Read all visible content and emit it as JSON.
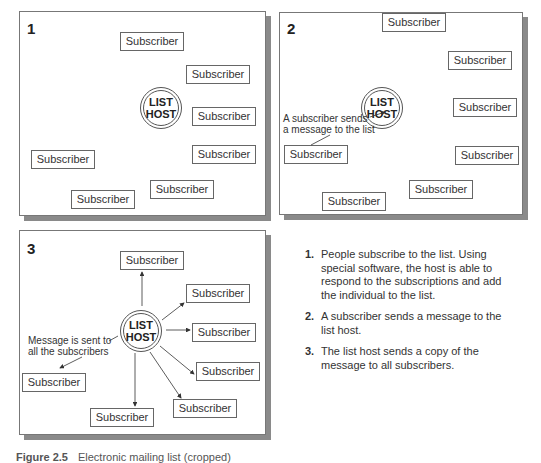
{
  "panels": [
    {
      "number": "1",
      "host_label": [
        "LIST",
        "HOST"
      ],
      "subscribers": [
        "Subscriber",
        "Subscriber",
        "Subscriber",
        "Subscriber",
        "Subscriber",
        "Subscriber",
        "Subscriber"
      ]
    },
    {
      "number": "2",
      "host_label": [
        "LIST",
        "HOST"
      ],
      "annotation": [
        "A subscriber sends",
        "a message to the list"
      ],
      "subscribers": [
        "Subscriber",
        "Subscriber",
        "Subscriber",
        "Subscriber",
        "Subscriber",
        "Subscriber",
        "Subscriber"
      ]
    },
    {
      "number": "3",
      "host_label": [
        "LIST",
        "HOST"
      ],
      "annotation": [
        "Message is sent to",
        "all the subscribers"
      ],
      "subscribers": [
        "Subscriber",
        "Subscriber",
        "Subscriber",
        "Subscriber",
        "Subscriber",
        "Subscriber",
        "Subscriber"
      ]
    }
  ],
  "steps": [
    {
      "num": "1.",
      "text": "People subscribe to the list. Using special software, the host is able to respond to the subscriptions and add the individual to the list."
    },
    {
      "num": "2.",
      "text": "A subscriber sends a message to the list host."
    },
    {
      "num": "3.",
      "text": "The list host sends a copy of the message to all subscribers."
    }
  ],
  "caption": {
    "label": "Figure 2.5",
    "text": "Electronic mailing list (cropped)"
  },
  "colors": {
    "border": "#666666",
    "shadow": "#8a8a8a",
    "text": "#222222"
  }
}
